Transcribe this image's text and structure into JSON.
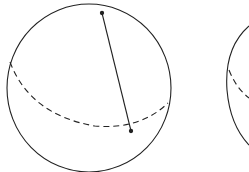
{
  "figure": {
    "stroke_color": "#222222",
    "spheres": [
      {
        "name": "left-sphere",
        "center": [
          89,
          86
        ],
        "radius": 83,
        "chord": {
          "start": [
            102,
            13
          ],
          "end": [
            131,
            131
          ]
        }
      },
      {
        "name": "right-sphere",
        "center": [
          311,
          86
        ],
        "radius": 83
      }
    ]
  }
}
